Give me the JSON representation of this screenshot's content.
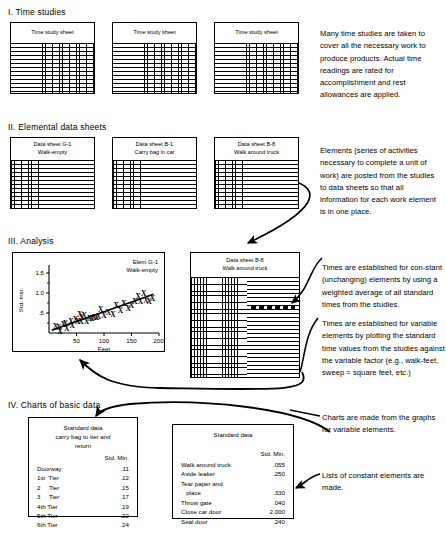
{
  "sections": {
    "one": {
      "title": "I.  Time studies",
      "sheets": [
        {
          "label": "Time study sheet"
        },
        {
          "label": "Time study sheet"
        },
        {
          "label": "Time study sheet"
        }
      ],
      "note": "Many time studies are taken to cover all the necessary work to produce products. Actual time readings are rated for accomplishment and rest allowances are applied."
    },
    "two": {
      "title": "II. Elemental data sheets",
      "sheets": [
        {
          "line1": "Data sheet G-1",
          "line2": "Walk-empty"
        },
        {
          "line1": "Data sheet B-1",
          "line2": "Carry bag in car"
        },
        {
          "line1": "Data sheet B-8",
          "line2": "Walk around truck"
        }
      ],
      "note": "Elements (series of activities necessary to complete a unit of work) are posted from the studies to data sheets so that all information for each work element is in one place."
    },
    "three": {
      "title": "III.  Analysis",
      "sheet": {
        "line1": "Data sheet B-8",
        "line2": "Walk around truck"
      },
      "note_constant": "Times are established for con-stant (unchanging) elements by using a weighted average of all standard times from the studies.",
      "note_variable": "Times are established for variable elements by plotting the standard time values from the studies against the variable factor (e.g., walk-feet, sweep = square feet, etc.)"
    },
    "four": {
      "title": "IV.  Charts of basic data",
      "note_charts": "Charts are made from the graphs for variable elements.",
      "note_lists": "Lists of constant elements are made."
    }
  },
  "chart_data": {
    "type": "scatter",
    "title": "Elem G-1",
    "subtitle": "Walk-empty",
    "xlabel": "Feet",
    "ylabel": "Std. min.",
    "xlim": [
      0,
      200
    ],
    "ylim": [
      0,
      1.65
    ],
    "xticks": [
      50,
      100,
      150,
      200
    ],
    "xticklabels": [
      "50",
      "100",
      "150",
      "200"
    ],
    "xtick_suffix": "′",
    "yticks": [
      0.5,
      1.0,
      1.5
    ],
    "yticklabels": [
      ".5",
      "1.0",
      "1.5"
    ],
    "grid": false,
    "legend": "none",
    "trendline": {
      "x0": 5,
      "y0": 0.07,
      "x1": 190,
      "y1": 0.97
    },
    "points": [
      {
        "x": 12,
        "y": 0.16
      },
      {
        "x": 18,
        "y": 0.13
      },
      {
        "x": 20,
        "y": 0.05
      },
      {
        "x": 26,
        "y": 0.22
      },
      {
        "x": 30,
        "y": 0.24
      },
      {
        "x": 32,
        "y": 0.11
      },
      {
        "x": 40,
        "y": 0.3
      },
      {
        "x": 42,
        "y": 0.18
      },
      {
        "x": 48,
        "y": 0.33
      },
      {
        "x": 52,
        "y": 0.28
      },
      {
        "x": 56,
        "y": 0.46
      },
      {
        "x": 58,
        "y": 0.3
      },
      {
        "x": 60,
        "y": 0.4
      },
      {
        "x": 64,
        "y": 0.43
      },
      {
        "x": 68,
        "y": 0.28
      },
      {
        "x": 74,
        "y": 0.36
      },
      {
        "x": 78,
        "y": 0.37
      },
      {
        "x": 82,
        "y": 0.38
      },
      {
        "x": 86,
        "y": 0.4
      },
      {
        "x": 90,
        "y": 0.42
      },
      {
        "x": 94,
        "y": 0.6
      },
      {
        "x": 100,
        "y": 0.45
      },
      {
        "x": 108,
        "y": 0.52
      },
      {
        "x": 116,
        "y": 0.47
      },
      {
        "x": 122,
        "y": 0.68
      },
      {
        "x": 130,
        "y": 0.57
      },
      {
        "x": 136,
        "y": 0.73
      },
      {
        "x": 144,
        "y": 0.62
      },
      {
        "x": 150,
        "y": 0.7
      },
      {
        "x": 156,
        "y": 0.8
      },
      {
        "x": 162,
        "y": 0.92
      },
      {
        "x": 166,
        "y": 0.78
      },
      {
        "x": 172,
        "y": 0.99
      },
      {
        "x": 176,
        "y": 0.82
      },
      {
        "x": 182,
        "y": 0.8
      },
      {
        "x": 188,
        "y": 0.86
      }
    ]
  },
  "tables": {
    "left": {
      "title_line1": "Standard data",
      "title_line2": "carry bag to tier and",
      "title_line3": "return",
      "unit_header": "Std. Min.",
      "rows": [
        {
          "label": "Doorway",
          "value": ".11"
        },
        {
          "label": "1st  Tier",
          "value": ".12"
        },
        {
          "label": "2     Tier",
          "value": ".15"
        },
        {
          "label": "3     Tier",
          "value": ".17"
        },
        {
          "label": "4th Tier",
          "value": ".19"
        },
        {
          "label": "5th Tier",
          "value": ".22"
        },
        {
          "label": "6th Tier",
          "value": ".24"
        }
      ]
    },
    "right": {
      "title_line1": "Standard data",
      "unit_header": "Std. Min.",
      "rows": [
        {
          "label": "Walk around truck",
          "value": ".055"
        },
        {
          "label": "Aside leaker",
          "value": ".250"
        },
        {
          "label": "Tear paper and",
          "value": ""
        },
        {
          "label": "   place",
          "value": ".330"
        },
        {
          "label": "Throw gate",
          "value": ".040"
        },
        {
          "label": "Close car door",
          "value": "2.000"
        },
        {
          "label": "Seal door",
          "value": ".240"
        }
      ]
    }
  }
}
